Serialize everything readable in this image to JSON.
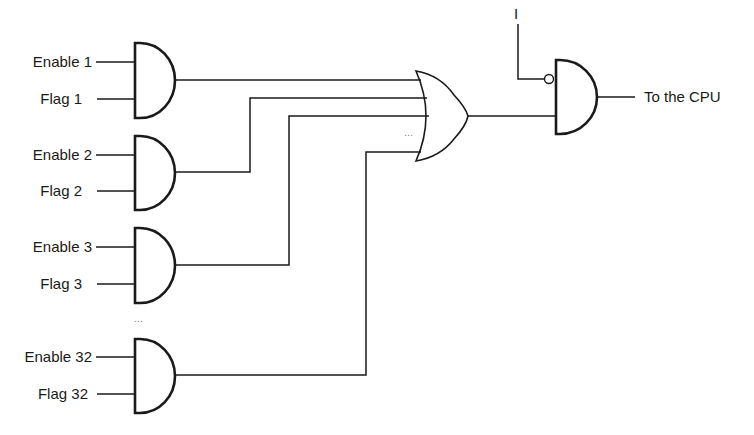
{
  "diagram": {
    "inputs": [
      {
        "enable": "Enable 1",
        "flag": "Flag 1"
      },
      {
        "enable": "Enable 2",
        "flag": "Flag 2"
      },
      {
        "enable": "Enable 3",
        "flag": "Flag 3"
      },
      {
        "enable": "Enable 32",
        "flag": "Flag 32"
      }
    ],
    "ellipsis_between_gates": "...",
    "ellipsis_or_inputs": "...",
    "inhibit_input_label": "I",
    "output_label": "To the CPU",
    "line_color": "#1a1a1a"
  }
}
